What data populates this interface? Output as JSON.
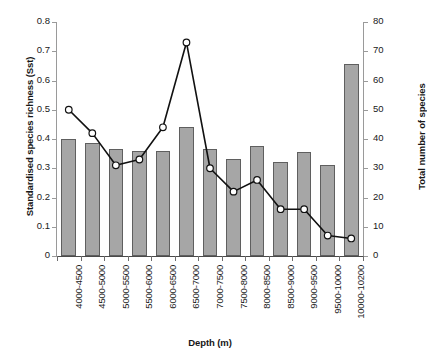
{
  "chart_data": {
    "type": "bar",
    "title": "",
    "xlabel": "Depth (m)",
    "ylabel": "Standardised species richness (Sst)",
    "y2label": "Total number of species",
    "grid": false,
    "legend": "none",
    "categories": [
      "4000-4500",
      "4500-5000",
      "5000-5500",
      "5500-6000",
      "6000-6500",
      "6500-7000",
      "7000-7500",
      "7500-8000",
      "8000-8500",
      "8500-9000",
      "9000-9500",
      "9500-10000",
      "10000-10200"
    ],
    "ylim": [
      0,
      0.8
    ],
    "yticks": [
      "0",
      "0.1",
      "0.2",
      "0.3",
      "0.4",
      "0.5",
      "0.6",
      "0.7",
      "0.8"
    ],
    "ytick_values": [
      0,
      0.1,
      0.2,
      0.3,
      0.4,
      0.5,
      0.6,
      0.7,
      0.8
    ],
    "y2lim": [
      0,
      80
    ],
    "y2ticks": [
      "0",
      "10",
      "20",
      "30",
      "40",
      "50",
      "60",
      "70",
      "80"
    ],
    "y2tick_values": [
      0,
      10,
      20,
      30,
      40,
      50,
      60,
      70,
      80
    ],
    "series": [
      {
        "name": "Standardised species richness (Sst)",
        "type": "bar",
        "axis": "left",
        "color": "#a6a6a6",
        "edge_color": "#5f5f5f",
        "values": [
          0.4,
          0.385,
          0.365,
          0.36,
          0.36,
          0.44,
          0.365,
          0.33,
          0.375,
          0.32,
          0.355,
          0.31,
          0.655
        ]
      },
      {
        "name": "Total number of species",
        "type": "line",
        "axis": "right",
        "color": "#111111",
        "marker": "open-circle",
        "marker_fill": "#ffffff",
        "values": [
          50,
          42,
          31,
          33,
          44,
          73,
          30,
          22,
          26,
          16,
          16,
          7,
          6
        ]
      }
    ]
  }
}
